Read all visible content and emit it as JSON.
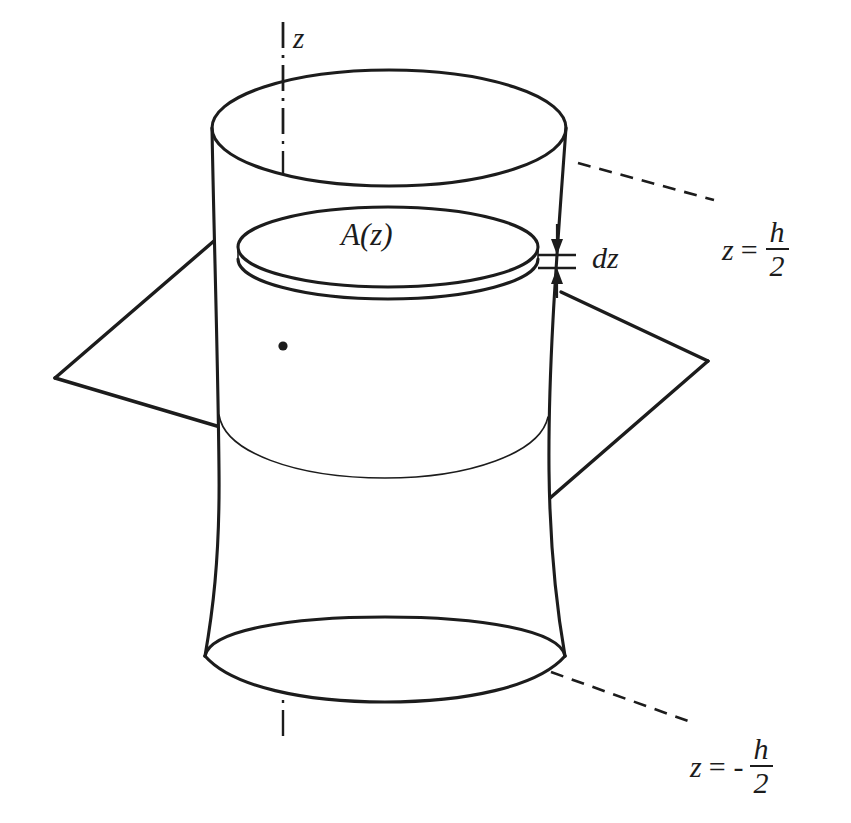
{
  "figure": {
    "background_color": "#ffffff",
    "line_color": "#1c1c1c",
    "width": 851,
    "height": 823
  },
  "labels": {
    "axis": "z",
    "cross_section_area": "A(z)",
    "thickness": "dz",
    "top_plane": {
      "symbol": "z",
      "equals": "=",
      "sign": "",
      "numerator": "h",
      "denominator": "2",
      "full": "z = h/2"
    },
    "bottom_plane": {
      "symbol": "z",
      "equals": "=",
      "sign": "-",
      "numerator": "h",
      "denominator": "2",
      "full": "z = - h/2"
    }
  },
  "geometry": {
    "solid": {
      "name": "hyperboloid-of-revolution",
      "top_ellipse": {
        "cx": 389,
        "cy": 128,
        "rx": 178,
        "ry": 58
      },
      "bottom_ellipse": {
        "cx": 385,
        "cy": 660,
        "rx": 180,
        "ry": 42
      },
      "waist_y": 470
    },
    "slab": {
      "name": "area-element-disc",
      "top_ellipse": {
        "cx": 388,
        "cy": 247,
        "rx": 150,
        "ry": 40
      },
      "thickness_px": 12
    },
    "cutting_plane": {
      "name": "horizontal-plane",
      "left_corner": {
        "x": 55,
        "y": 378
      },
      "right_corner": {
        "x": 708,
        "y": 361
      },
      "near_corner": {
        "x": 527,
        "y": 518
      },
      "far_corner": {
        "x": 236,
        "y": 222
      }
    },
    "axis": {
      "x": 283,
      "y_top": 22,
      "y_bottom": 736,
      "dot": {
        "x": 283,
        "y": 346
      }
    },
    "dz_marker": {
      "tick_x1": 540,
      "tick_x2": 574,
      "tick_y_upper": 255,
      "tick_y_lower": 267,
      "arrow_top_y": 224,
      "arrow_bottom_y": 298
    },
    "leaders": [
      {
        "name": "leader-top",
        "from": {
          "x": 577,
          "y": 163
        },
        "to": {
          "x": 712,
          "y": 199
        }
      },
      {
        "name": "leader-bottom",
        "from": {
          "x": 552,
          "y": 673
        },
        "to": {
          "x": 686,
          "y": 721
        }
      }
    ]
  }
}
